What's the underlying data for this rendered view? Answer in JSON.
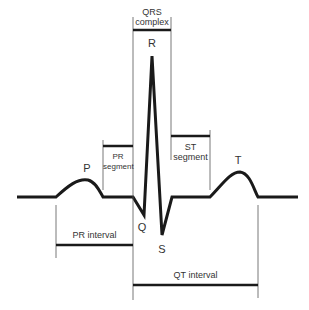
{
  "diagram": {
    "colors": {
      "trace": "#1a1a1a",
      "guide": "#555555",
      "text": "#333333"
    },
    "waves": {
      "p": "P",
      "q": "Q",
      "r": "R",
      "s": "S",
      "t": "T"
    },
    "segments": {
      "qrs_line1": "QRS",
      "qrs_line2": "complex",
      "pr_seg_line1": "PR",
      "pr_seg_line2": "segment",
      "st_seg_line1": "ST",
      "st_seg_line2": "segment"
    },
    "intervals": {
      "pr": "PR interval",
      "qt": "QT interval"
    }
  }
}
